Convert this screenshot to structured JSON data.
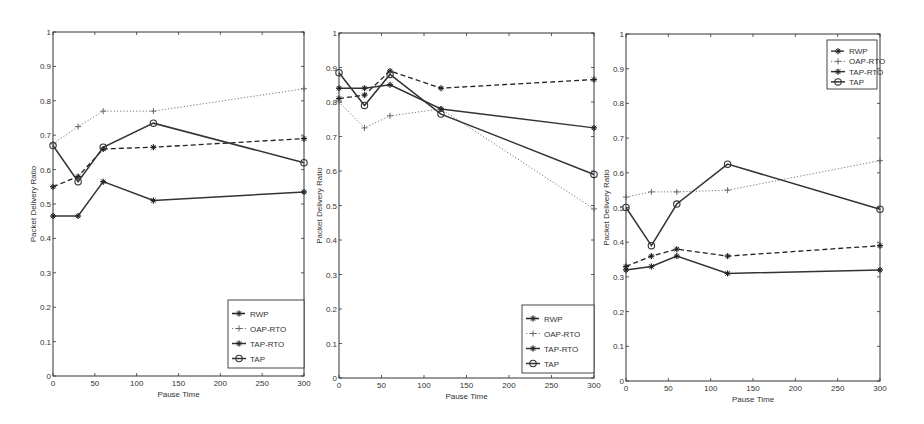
{
  "chart_data": [
    {
      "type": "line",
      "title": "",
      "xlabel": "Pause Time",
      "ylabel": "Packet Delivery Ratio",
      "xlim": [
        0,
        300
      ],
      "ylim": [
        0,
        1
      ],
      "xticks": [
        0,
        50,
        100,
        150,
        200,
        250,
        300
      ],
      "yticks": [
        0,
        0.1,
        0.2,
        0.3,
        0.4,
        0.5,
        0.6,
        0.7,
        0.8,
        0.9,
        1
      ],
      "ytick_labels": [
        "0",
        "0.1",
        "0.2",
        "0.3",
        "0.4",
        "0.5",
        "0.6",
        "0.7",
        "0.8",
        "0.9",
        "1"
      ],
      "grid": false,
      "legend_position": "bottom-right",
      "x": [
        0,
        30,
        60,
        120,
        300
      ],
      "series": [
        {
          "name": "RWP",
          "style": "dashed",
          "marker": "*",
          "values": [
            0.55,
            0.58,
            0.66,
            0.665,
            0.69
          ]
        },
        {
          "name": "OAP-RTO",
          "style": "dotted",
          "marker": "+",
          "values": [
            0.675,
            0.725,
            0.77,
            0.77,
            0.835
          ]
        },
        {
          "name": "TAP-RTO",
          "style": "solid",
          "marker": "*",
          "values": [
            0.465,
            0.465,
            0.565,
            0.51,
            0.535
          ]
        },
        {
          "name": "TAP",
          "style": "solid",
          "marker": "o",
          "values": [
            0.67,
            0.565,
            0.665,
            0.735,
            0.62
          ]
        }
      ]
    },
    {
      "type": "line",
      "title": "",
      "xlabel": "Pause Time",
      "ylabel": "Packet Delivery Ratio",
      "xlim": [
        0,
        300
      ],
      "ylim": [
        0,
        1
      ],
      "xticks": [
        0,
        50,
        100,
        150,
        200,
        250,
        300
      ],
      "yticks": [
        0,
        0.1,
        0.2,
        0.3,
        0.4,
        0.5,
        0.6,
        0.7,
        0.8,
        0.9,
        1
      ],
      "ytick_labels": [
        "0",
        "0.1",
        "0.2",
        "0.3",
        "0.4",
        "0.5",
        "0.6",
        "0.7",
        "0.8",
        "0.9",
        "1"
      ],
      "grid": false,
      "legend_position": "bottom-right",
      "x": [
        0,
        30,
        60,
        120,
        300
      ],
      "series": [
        {
          "name": "RWP",
          "style": "dashed",
          "marker": "*",
          "values": [
            0.81,
            0.82,
            0.89,
            0.84,
            0.865
          ]
        },
        {
          "name": "OAP-RTO",
          "style": "dotted",
          "marker": "+",
          "values": [
            0.8,
            0.725,
            0.76,
            0.78,
            0.49
          ]
        },
        {
          "name": "TAP-RTO",
          "style": "solid",
          "marker": "*",
          "values": [
            0.84,
            0.84,
            0.85,
            0.78,
            0.725
          ]
        },
        {
          "name": "TAP",
          "style": "solid",
          "marker": "o",
          "values": [
            0.885,
            0.79,
            0.88,
            0.765,
            0.59
          ]
        }
      ]
    },
    {
      "type": "line",
      "title": "",
      "xlabel": "Pause Time",
      "ylabel": "Packet Delivery Ratio",
      "xlim": [
        0,
        300
      ],
      "ylim": [
        0,
        1
      ],
      "xticks": [
        0,
        50,
        100,
        150,
        200,
        250,
        300
      ],
      "yticks": [
        0,
        0.1,
        0.2,
        0.3,
        0.4,
        0.5,
        0.6,
        0.7,
        0.8,
        0.9,
        1
      ],
      "ytick_labels": [
        "0",
        "0.1",
        "0.2",
        "0.3",
        "0.4",
        "0.5",
        "0.6",
        "0.7",
        "0.8",
        "0.9",
        "1"
      ],
      "grid": false,
      "legend_position": "top-right",
      "x": [
        0,
        30,
        60,
        120,
        300
      ],
      "series": [
        {
          "name": "RWP",
          "style": "dashed",
          "marker": "*",
          "values": [
            0.33,
            0.36,
            0.38,
            0.36,
            0.39
          ]
        },
        {
          "name": "OAP-RTO",
          "style": "dotted",
          "marker": "+",
          "values": [
            0.53,
            0.545,
            0.545,
            0.55,
            0.635
          ]
        },
        {
          "name": "TAP-RTO",
          "style": "solid",
          "marker": "*",
          "values": [
            0.32,
            0.33,
            0.36,
            0.31,
            0.32
          ]
        },
        {
          "name": "TAP",
          "style": "solid",
          "marker": "o",
          "values": [
            0.5,
            0.39,
            0.51,
            0.625,
            0.495
          ]
        }
      ]
    }
  ]
}
